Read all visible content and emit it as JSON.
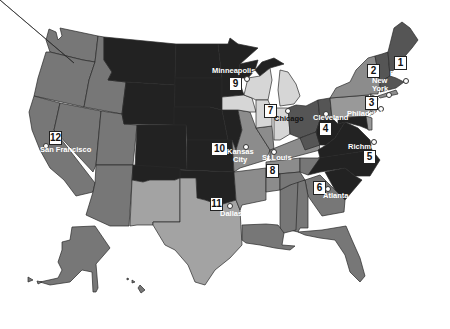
{
  "map": {
    "title": "Federal Reserve Districts",
    "colors": {
      "background": "#ffffff",
      "darkest": "#222222",
      "dark": "#555555",
      "mid": "#777777",
      "midlight": "#8c8c8c",
      "light": "#a3a3a3",
      "lightest": "#d6d6d6",
      "border": "#2a2a2a"
    },
    "districts": [
      {
        "number": "1",
        "city": "Boston"
      },
      {
        "number": "2",
        "city": "New York"
      },
      {
        "number": "3",
        "city": "Philadelphia"
      },
      {
        "number": "4",
        "city": "Cleveland"
      },
      {
        "number": "5",
        "city": "Richmond"
      },
      {
        "number": "6",
        "city": "Atlanta"
      },
      {
        "number": "7",
        "city": "Chicago"
      },
      {
        "number": "8",
        "city": "St.Louis"
      },
      {
        "number": "9",
        "city": "Minneapolis"
      },
      {
        "number": "10",
        "city": "Kansas City"
      },
      {
        "number": "11",
        "city": "Dallas"
      },
      {
        "number": "12",
        "city": "San Francisco"
      }
    ],
    "labels": {
      "d1": "1",
      "d2": "2",
      "d3": "3",
      "d4": "4",
      "d5": "5",
      "d6": "6",
      "d7": "7",
      "d8": "8",
      "d9": "9",
      "d10": "10",
      "d11": "11",
      "d12": "12",
      "boston": "Boston",
      "new": "New",
      "york": "York",
      "philadelphia": "Philadelphia",
      "cleveland": "Cleveland",
      "richmond": "Richmond",
      "atlanta": "Atlanta",
      "chicago": "Chicago",
      "stlouis": "St.Louis",
      "minneapolis": "Minneapolis",
      "kansas": "Kansas",
      "city": "City",
      "dallas": "Dallas",
      "sanfrancisco": "San Francisco"
    }
  }
}
